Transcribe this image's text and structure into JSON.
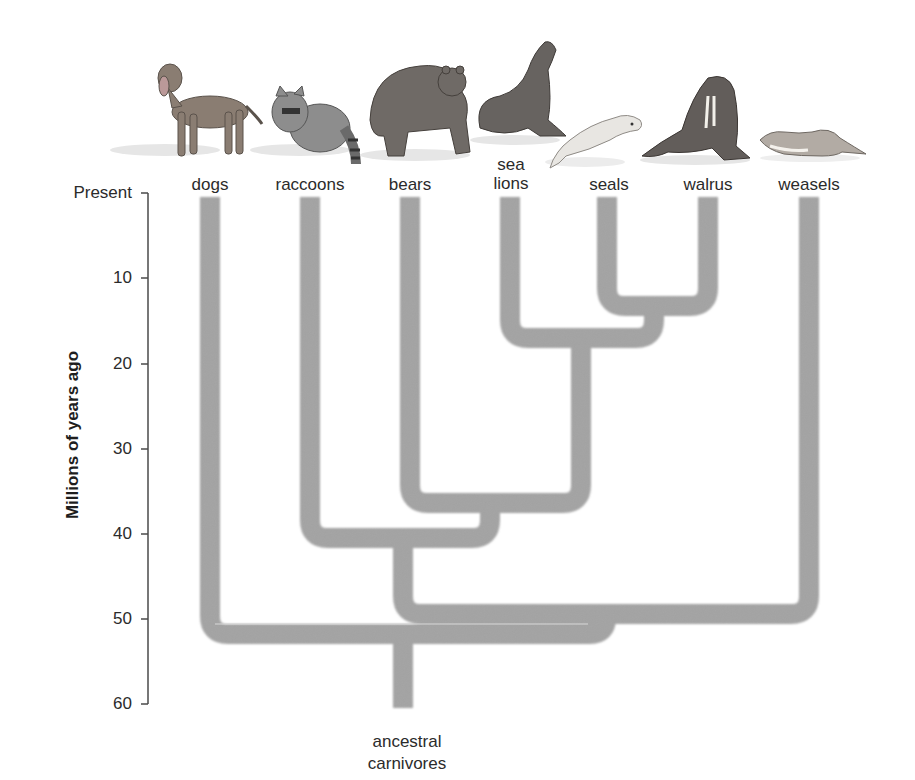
{
  "diagram": {
    "type": "phylogenetic-tree",
    "axis": {
      "title": "Millions of years ago",
      "ticks": [
        {
          "label": "Present",
          "value": 0
        },
        {
          "label": "10",
          "value": 10
        },
        {
          "label": "20",
          "value": 20
        },
        {
          "label": "30",
          "value": 30
        },
        {
          "label": "40",
          "value": 40
        },
        {
          "label": "50",
          "value": 50
        },
        {
          "label": "60",
          "value": 60
        }
      ]
    },
    "taxa": [
      {
        "id": "dogs",
        "label": "dogs",
        "illustration": "dog-illustration"
      },
      {
        "id": "raccoons",
        "label": "raccoons",
        "illustration": "raccoon-illustration"
      },
      {
        "id": "bears",
        "label": "bears",
        "illustration": "bear-illustration"
      },
      {
        "id": "sea_lions",
        "label_line1": "sea",
        "label_line2": "lions",
        "illustration": "sea-lion-illustration"
      },
      {
        "id": "seals",
        "label": "seals",
        "illustration": "seal-illustration"
      },
      {
        "id": "walrus",
        "label": "walrus",
        "illustration": "walrus-illustration"
      },
      {
        "id": "weasels",
        "label": "weasels",
        "illustration": "weasel-illustration"
      }
    ],
    "root": {
      "label_line1": "ancestral",
      "label_line2": "carnivores"
    },
    "divergences_mya": [
      {
        "clade": [
          "seals",
          "walrus"
        ],
        "time": 13.5
      },
      {
        "clade": [
          "sea_lions",
          "seals",
          "walrus"
        ],
        "time": 17
      },
      {
        "clade": [
          "bears",
          "sea_lions",
          "seals",
          "walrus"
        ],
        "time": 36
      },
      {
        "clade": [
          "raccoons",
          "bears",
          "sea_lions",
          "seals",
          "walrus"
        ],
        "time": 40.5
      },
      {
        "clade": [
          "raccoons",
          "bears",
          "sea_lions",
          "seals",
          "walrus",
          "weasels"
        ],
        "time": 49.5
      },
      {
        "clade": [
          "dogs",
          "raccoons",
          "bears",
          "sea_lions",
          "seals",
          "walrus",
          "weasels"
        ],
        "time": 52
      },
      {
        "clade": [
          "root"
        ],
        "time": 60
      }
    ],
    "colors": {
      "branch": "#a3a3a3",
      "axis": "#444444",
      "text": "#2b2b2b"
    }
  }
}
